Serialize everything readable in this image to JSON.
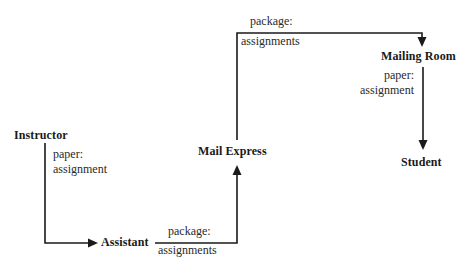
{
  "diagram": {
    "type": "flow",
    "nodes": [
      {
        "id": "instructor",
        "label": "Instructor"
      },
      {
        "id": "assistant",
        "label": "Assistant"
      },
      {
        "id": "mail_express",
        "label": "Mail Express"
      },
      {
        "id": "mailing_room",
        "label": "Mailing Room"
      },
      {
        "id": "student",
        "label": "Student"
      }
    ],
    "edges": [
      {
        "from": "instructor",
        "to": "assistant",
        "label_line1": "paper:",
        "label_line2": "assignment"
      },
      {
        "from": "assistant",
        "to": "mail_express",
        "label_line1": "package:",
        "label_line2": "assignments"
      },
      {
        "from": "mail_express",
        "to": "mailing_room",
        "label_line1": "package:",
        "label_line2": "assignments"
      },
      {
        "from": "mailing_room",
        "to": "student",
        "label_line1": "paper:",
        "label_line2": "assignment"
      }
    ],
    "line_color": "#1a1a1a"
  }
}
